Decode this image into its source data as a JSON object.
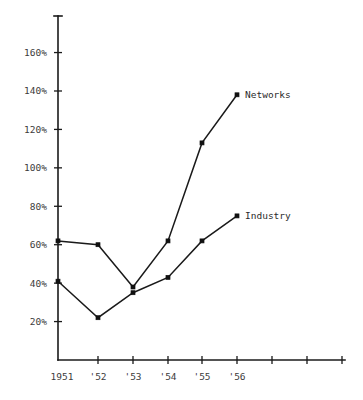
{
  "chart_data": {
    "type": "line",
    "title": "",
    "subtitle": "",
    "xlabel": "",
    "ylabel": "",
    "categories": [
      "1951",
      "'52",
      "'53",
      "'54",
      "'55",
      "'56"
    ],
    "x_tick_labels": [
      "1951",
      "'52",
      "'53",
      "'54",
      "'55",
      "'56",
      "",
      "",
      ""
    ],
    "y_tick_labels": [
      "20%",
      "40%",
      "60%",
      "80%",
      "100%",
      "120%",
      "140%",
      "160%"
    ],
    "y_tick_values": [
      20,
      40,
      60,
      80,
      100,
      120,
      140,
      160
    ],
    "ylim": [
      0,
      175
    ],
    "xlim": [
      0,
      8
    ],
    "grid": false,
    "legend_position": "inline-right-of-last-point",
    "series": [
      {
        "name": "Networks",
        "label": "Networks",
        "values": [
          62,
          60,
          38,
          62,
          113,
          138
        ],
        "color": "#1a1a1a",
        "marker": "square"
      },
      {
        "name": "Industry",
        "label": "Industry",
        "values": [
          41,
          22,
          35,
          43,
          62,
          75
        ],
        "color": "#1a1a1a",
        "marker": "square"
      }
    ],
    "annotations": [
      {
        "text": "Networks",
        "series": "Networks",
        "at_category": "'56"
      },
      {
        "text": "Industry",
        "series": "Industry",
        "at_category": "'56"
      }
    ],
    "axis_color": "#1a1a1a",
    "background_color": "#ffffff"
  }
}
